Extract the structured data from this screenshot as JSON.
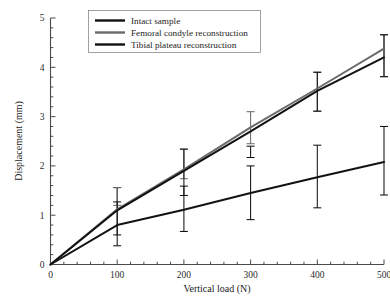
{
  "chart_data": {
    "type": "line",
    "title": "",
    "subtitle": "",
    "xlabel": "Vertical load (N)",
    "ylabel": "Displacement (mm)",
    "x": [
      0,
      100,
      200,
      300,
      400,
      500
    ],
    "categories": [
      "0",
      "100",
      "200",
      "300",
      "400",
      "500"
    ],
    "xlim": [
      0,
      500
    ],
    "ylim": [
      0,
      5
    ],
    "xticks": [
      "0",
      "100",
      "200",
      "300",
      "400",
      "500"
    ],
    "yticks": [
      "0",
      "1",
      "2",
      "3",
      "4",
      "5"
    ],
    "xtick_values": [
      0,
      100,
      200,
      300,
      400,
      500
    ],
    "ytick_values": [
      0,
      1,
      2,
      3,
      4,
      5
    ],
    "x_minor_tick_step": 20,
    "y_minor_tick_step": 0.2,
    "grid": false,
    "legend_position": "top-left",
    "series": [
      {
        "name": "Intact sample",
        "color": "#121212",
        "linewidth": 2.0,
        "values": [
          0,
          0.8,
          1.11,
          1.45,
          1.77,
          2.08
        ],
        "error_low": [
          0,
          0.6,
          0.67,
          0.91,
          1.15,
          1.41
        ],
        "error_high": [
          0,
          1.56,
          1.59,
          2.0,
          2.42,
          2.8
        ]
      },
      {
        "name": "Femoral condyle reconstruction",
        "color": "#6b6b6b",
        "linewidth": 2.0,
        "values": [
          0,
          1.12,
          1.93,
          2.78,
          3.57,
          4.38
        ],
        "error_low": [
          0,
          1.2,
          1.74,
          2.45,
          3.11,
          3.81
        ],
        "error_high": [
          0,
          1.56,
          2.34,
          3.1,
          3.9,
          4.66
        ]
      },
      {
        "name": "Tibial plateau reconstruction",
        "color": "#121212",
        "linewidth": 2.0,
        "values": [
          0,
          1.1,
          1.9,
          2.7,
          3.52,
          4.2
        ],
        "error_low": [
          0,
          0.38,
          1.4,
          2.17,
          3.11,
          3.81
        ],
        "error_high": [
          0,
          1.27,
          2.34,
          2.4,
          3.9,
          4.66
        ]
      }
    ],
    "annotations": []
  },
  "legend": {
    "items": [
      {
        "label": "Intact sample",
        "swatch": "legend-swatch-intact"
      },
      {
        "label": "Femoral condyle reconstruction",
        "swatch": "legend-swatch-femoral"
      },
      {
        "label": "Tibial plateau reconstruction",
        "swatch": "legend-swatch-tibial"
      }
    ]
  },
  "colors": {
    "background": "#ffffff",
    "axis": "#4a4a4a",
    "text": "#1c1c1c",
    "intact": "#121212",
    "femoral": "#6b6b6b",
    "tibial": "#121212",
    "legend_border": "#8a8a8a"
  }
}
